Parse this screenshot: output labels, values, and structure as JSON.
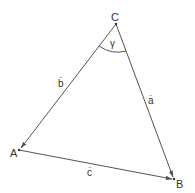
{
  "diagram": {
    "type": "vector-triangle",
    "colors": {
      "line": "#555555",
      "text": "#333333",
      "background": "#ffffff"
    },
    "vertices": [
      {
        "id": "C",
        "label": "C",
        "x": 116,
        "y": 24
      },
      {
        "id": "A",
        "label": "A",
        "x": 19,
        "y": 150
      },
      {
        "id": "B",
        "label": "B",
        "x": 174,
        "y": 179
      }
    ],
    "vectors": [
      {
        "id": "b",
        "label": "b",
        "from": "C",
        "to": "A",
        "arrow": "→"
      },
      {
        "id": "a",
        "label": "a",
        "from": "C",
        "to": "B",
        "arrow": "→"
      },
      {
        "id": "c",
        "label": "c",
        "from": "A",
        "to": "B",
        "arrow": "→"
      }
    ],
    "angle": {
      "label": "γ",
      "vertex": "C"
    }
  }
}
